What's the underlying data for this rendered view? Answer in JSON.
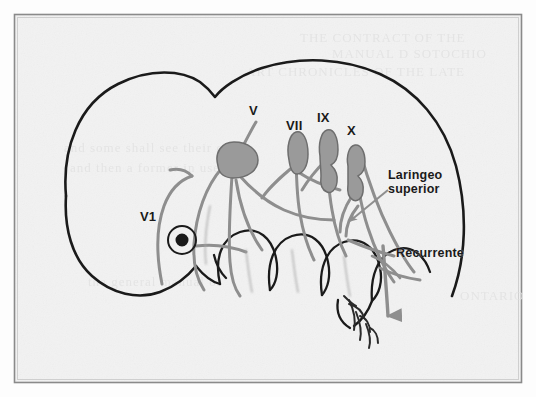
{
  "figure": {
    "kind": "scanned-hand-drawn-anatomical-diagram",
    "border_color": "#8a8a8a",
    "paper_color": "#f2f2f2",
    "ink_color": "#1a1a1a",
    "nerve_color": "#8e8e8e",
    "ganglion_fill": "#9a9a9a"
  },
  "labels": {
    "trigeminal": "V",
    "ophthalmic": "V1",
    "facial": "VII",
    "glossopharyngeal": "IX",
    "vagus": "X",
    "laryngeal_superior": "Laringeo\nsuperior",
    "recurrent": "Recurrente"
  },
  "signature": {
    "text": "'15"
  }
}
